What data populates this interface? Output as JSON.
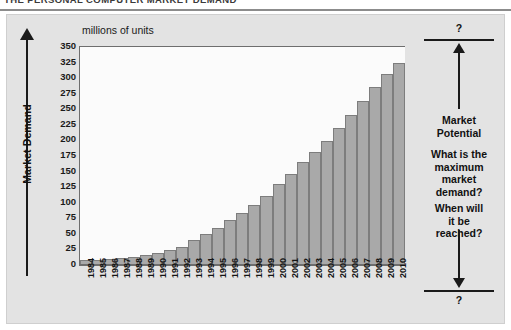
{
  "header": {
    "title": "THE PERSONAL COMPUTER MARKET DEMAND"
  },
  "chart_panel": {
    "units_caption": "millions of units",
    "y_axis_title": "Market Demand"
  },
  "annotations": {
    "question_mark_top": "?",
    "question_mark_bottom": "?",
    "market_potential": "Market\nPotential",
    "market_potential_line1": "Market",
    "market_potential_line2": "Potential",
    "question_1": "What is the maximum market demand?",
    "question_1_l1": "What is the",
    "question_1_l2": "maximum",
    "question_1_l3": "market",
    "question_1_l4": "demand?",
    "question_2": "When will it be reached?",
    "question_2_l1": "When will",
    "question_2_l2": "it be",
    "question_2_l3": "reached?"
  },
  "colors": {
    "panel_background": "#e3e3e3",
    "plot_background": "#fbfbfb",
    "bar_fill": "#a9a9a9",
    "bar_border": "#7d7d7d",
    "axis": "#6e6e6e",
    "text": "#111111",
    "title_rule": "#8c8c8c"
  },
  "chart_data": {
    "type": "bar",
    "title": "THE PERSONAL COMPUTER MARKET DEMAND",
    "subtitle": "millions of units",
    "xlabel": "",
    "ylabel": "Market Demand",
    "ylim": [
      0,
      350
    ],
    "yticks": [
      0,
      25,
      50,
      75,
      100,
      125,
      150,
      175,
      200,
      225,
      250,
      275,
      300,
      325,
      350
    ],
    "ytick_labels": [
      "0",
      "25",
      "50",
      "75",
      "100",
      "125",
      "150",
      "175",
      "200",
      "225",
      "250",
      "275",
      "300",
      "325",
      "350"
    ],
    "grid": false,
    "legend": false,
    "units": "millions of units",
    "categories": [
      "1984",
      "1985",
      "1986",
      "1987",
      "1988",
      "1989",
      "1990",
      "1991",
      "1992",
      "1993",
      "1994",
      "1995",
      "1996",
      "1997",
      "1998",
      "1999",
      "2000",
      "2001",
      "2002",
      "2003",
      "2004",
      "2005",
      "2006",
      "2007",
      "2008",
      "2009",
      "2010"
    ],
    "values": [
      6,
      7,
      8,
      10,
      12,
      15,
      18,
      22,
      28,
      38,
      48,
      58,
      70,
      82,
      95,
      110,
      128,
      145,
      163,
      180,
      198,
      218,
      240,
      262,
      285,
      305,
      322
    ]
  }
}
